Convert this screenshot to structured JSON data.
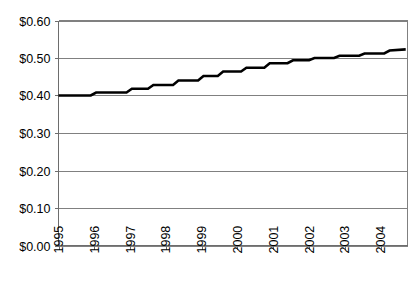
{
  "chart_data": {
    "type": "line",
    "title": "",
    "xlabel": "",
    "ylabel": "",
    "ylim": [
      0.0,
      0.6
    ],
    "xlim": [
      1995,
      2004.75
    ],
    "grid": true,
    "legend": false,
    "y_ticks": [
      0.0,
      0.1,
      0.2,
      0.3,
      0.4,
      0.5,
      0.6
    ],
    "y_ticklabels": [
      "$0.00",
      "$0.10",
      "$0.20",
      "$0.30",
      "$0.40",
      "$0.50",
      "$0.60"
    ],
    "x_ticks": [
      1995,
      1996,
      1997,
      1998,
      1999,
      2000,
      2001,
      2002,
      2003,
      2004
    ],
    "x_ticklabels": [
      "1995",
      "1996",
      "1997",
      "1998",
      "1999",
      "2000",
      "2001",
      "2002",
      "2003",
      "2004"
    ],
    "x_tick_rotation": 90,
    "series": [
      {
        "name": "value",
        "line_color": "#000000",
        "line_width": 2.6,
        "step_style": "stair",
        "x": [
          1995.0,
          1995.9,
          1996.05,
          1996.9,
          1997.05,
          1997.5,
          1997.65,
          1998.2,
          1998.35,
          1998.9,
          1999.05,
          1999.45,
          1999.6,
          2000.1,
          2000.25,
          2000.75,
          2000.9,
          2001.4,
          2001.55,
          2002.0,
          2002.15,
          2002.7,
          2002.85,
          2003.4,
          2003.55,
          2004.1,
          2004.25,
          2004.7
        ],
        "y": [
          0.4,
          0.4,
          0.408,
          0.408,
          0.418,
          0.418,
          0.428,
          0.428,
          0.44,
          0.44,
          0.452,
          0.452,
          0.464,
          0.464,
          0.474,
          0.474,
          0.486,
          0.486,
          0.494,
          0.494,
          0.5,
          0.5,
          0.506,
          0.506,
          0.512,
          0.512,
          0.52,
          0.523
        ]
      }
    ],
    "annotations": [],
    "axis_colors": {
      "gridline": "#808080",
      "axis": "#6d6d6d",
      "frame": "#808080",
      "background": "#ffffff",
      "text": "#000000"
    }
  }
}
